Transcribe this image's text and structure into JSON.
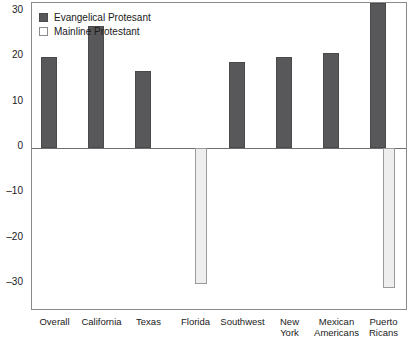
{
  "chart_data": {
    "type": "bar",
    "title": "",
    "xlabel": "",
    "ylabel": "",
    "ylim": [
      -36,
      32
    ],
    "yticks": [
      30,
      20,
      10,
      0,
      -10,
      -20,
      -30
    ],
    "ytick_labels": [
      "30",
      "20",
      "10",
      "0",
      "–10",
      "–20",
      "–30"
    ],
    "grid": false,
    "legend_position": "top-left",
    "categories": [
      "Overall",
      "California",
      "Texas",
      "Florida",
      "Southwest",
      "New\nYork",
      "Mexican\nAmericans",
      "Puerto\nRicans"
    ],
    "series": [
      {
        "name": "Evangelical Protesant",
        "color": "#58585a",
        "values": [
          20,
          27,
          17,
          null,
          19,
          20,
          21,
          32
        ]
      },
      {
        "name": "Mainline Protestant",
        "color": "#eeeeee",
        "values": [
          null,
          null,
          null,
          -30,
          null,
          null,
          null,
          -31
        ]
      }
    ]
  },
  "legend": {
    "entries": [
      {
        "label": "Evangelical Protesant",
        "swatch": "evangelical"
      },
      {
        "label": "Mainline Protestant",
        "swatch": "mainline"
      }
    ]
  }
}
